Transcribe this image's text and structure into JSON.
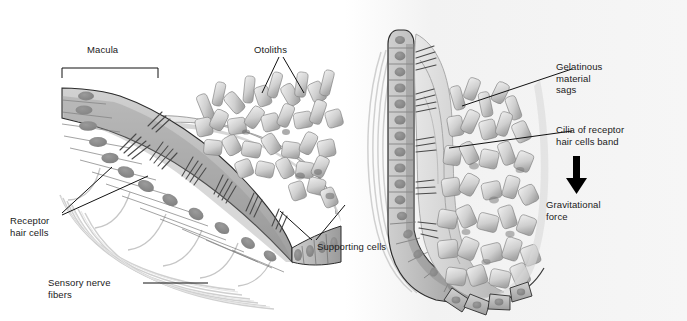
{
  "figure": {
    "panels": [
      {
        "name": "head-upright-panel",
        "position": "left"
      },
      {
        "name": "head-tilted-panel",
        "position": "right"
      }
    ]
  },
  "labels": {
    "macula": "Macula",
    "otoliths": "Otoliths",
    "receptor_hair_cells": "Receptor\nhair cells",
    "sensory_nerve_fibers": "Sensory nerve\nfibers",
    "supporting_cells": "Supporting cells",
    "gelatinous_material_sags": "Gelatinous\nmaterial\nsags",
    "cilia_band": "Cilia of receptor\nhair cells band",
    "gravitational_force": "Gravitational\nforce"
  },
  "colors": {
    "background": "#ffffff",
    "panel_tint": "#f4f4f4",
    "label_text": "#1a1a1a",
    "leader_line": "#111111",
    "arrow": "#000000",
    "cell_body": "#a9a9a9",
    "cell_body_light": "#c9c9c9",
    "nucleus": "#8a8a8a",
    "gelatin": "#d8d8d8",
    "gelatin_shadow": "#bdbdbd",
    "otolith_light": "#e3e3e3",
    "otolith_mid": "#c2c2c2",
    "otolith_dark": "#9a9a9a",
    "outline": "#2a2a2a",
    "nerve_fiber": "#cfcfcf"
  },
  "annotations": {
    "macula_bracket": "square-bracket-down",
    "otoliths_pointer": "two-diverging-leader-lines",
    "supporting_cells_pointer": "two-diverging-leader-lines",
    "receptor_hair_cells_pointer": "two-diverging-leader-lines",
    "sensory_nerve_pointer": "horizontal-leader-line",
    "gelatinous_pointer": "diagonal-leader-line",
    "cilia_pointer": "diagonal-leader-line",
    "gravity_pointer": "down-arrow"
  }
}
